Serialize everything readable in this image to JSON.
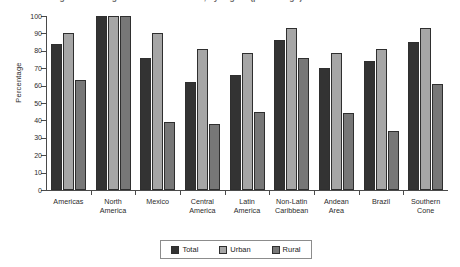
{
  "title": {
    "text": "Coverage of drinking water and sanitation, by region (percentage)",
    "clipped": true
  },
  "legend": {
    "position": "bottom-center",
    "items": [
      {
        "label": "Total",
        "color": "#333333",
        "swatch": "legend-swatch-total"
      },
      {
        "label": "Urban",
        "color": "#a6a6a6",
        "swatch": "legend-swatch-urban"
      },
      {
        "label": "Rural",
        "color": "#777777",
        "swatch": "legend-swatch-rural"
      }
    ]
  },
  "axes": {
    "ylabel": "Percentage",
    "xlabel": "",
    "yticks": [
      "0",
      "10",
      "20",
      "30",
      "40",
      "50",
      "60",
      "70",
      "80",
      "90",
      "100"
    ]
  },
  "chart_data": {
    "type": "bar",
    "title": "Coverage of drinking water and sanitation, by region (percentage)",
    "xlabel": "",
    "ylabel": "Percentage",
    "ylim": [
      0,
      100
    ],
    "ytick_step": 10,
    "grid": false,
    "legend_position": "bottom-center",
    "categories": [
      "Americas",
      "North America",
      "Mexico",
      "Central America",
      "Latin America",
      "Non-Latin Caribbean",
      "Andean Area",
      "Brazil",
      "Southern Cone"
    ],
    "category_lines": [
      [
        "Americas"
      ],
      [
        "North",
        "America"
      ],
      [
        "Mexico"
      ],
      [
        "Central",
        "America"
      ],
      [
        "Latin",
        "America"
      ],
      [
        "Non-Latin",
        "Caribbean"
      ],
      [
        "Andean",
        "Area"
      ],
      [
        "Brazil"
      ],
      [
        "Southern",
        "Cone"
      ]
    ],
    "series": [
      {
        "name": "Total",
        "color": "#333333",
        "values": [
          84,
          100,
          76,
          62,
          66,
          86,
          70,
          74,
          85
        ]
      },
      {
        "name": "Urban",
        "color": "#a6a6a6",
        "values": [
          90,
          100,
          90,
          81,
          79,
          93,
          79,
          81,
          93
        ]
      },
      {
        "name": "Rural",
        "color": "#777777",
        "values": [
          63,
          100,
          39,
          38,
          45,
          76,
          44,
          34,
          61
        ]
      }
    ]
  }
}
